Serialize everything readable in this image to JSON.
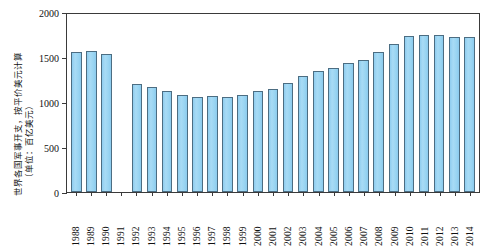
{
  "chart_data": {
    "type": "bar",
    "title": "",
    "ylabel_line1": "世界各国军事开支，按平价美元计算",
    "ylabel_line2": "（单位：百亿美元）",
    "xlabel": "",
    "ylim": [
      0,
      2000
    ],
    "yticks": [
      0,
      500,
      1000,
      1500,
      2000
    ],
    "grid": false,
    "legend": "none",
    "categories": [
      "1988",
      "1989",
      "1990",
      "1991",
      "1992",
      "1993",
      "1994",
      "1995",
      "1996",
      "1997",
      "1998",
      "1999",
      "2000",
      "2001",
      "2002",
      "2003",
      "2004",
      "2005",
      "2006",
      "2007",
      "2008",
      "2009",
      "2010",
      "2011",
      "2012",
      "2013",
      "2014"
    ],
    "values": [
      1560,
      1565,
      1530,
      null,
      1200,
      1170,
      1120,
      1080,
      1060,
      1065,
      1055,
      1080,
      1120,
      1150,
      1210,
      1290,
      1340,
      1380,
      1430,
      1470,
      1560,
      1640,
      1730,
      1750,
      1740,
      1725,
      1725
    ]
  },
  "axis": {
    "y_tick_labels": [
      "2000",
      "1500",
      "1000",
      "500",
      "0"
    ],
    "y_tick_values": [
      2000,
      1500,
      1000,
      500,
      0
    ]
  },
  "colors": {
    "bar_fill": "#9ad5f2",
    "bar_stroke": "#4c6d82",
    "axis": "#3a3a3a",
    "text": "#111111",
    "background": "#ffffff"
  }
}
